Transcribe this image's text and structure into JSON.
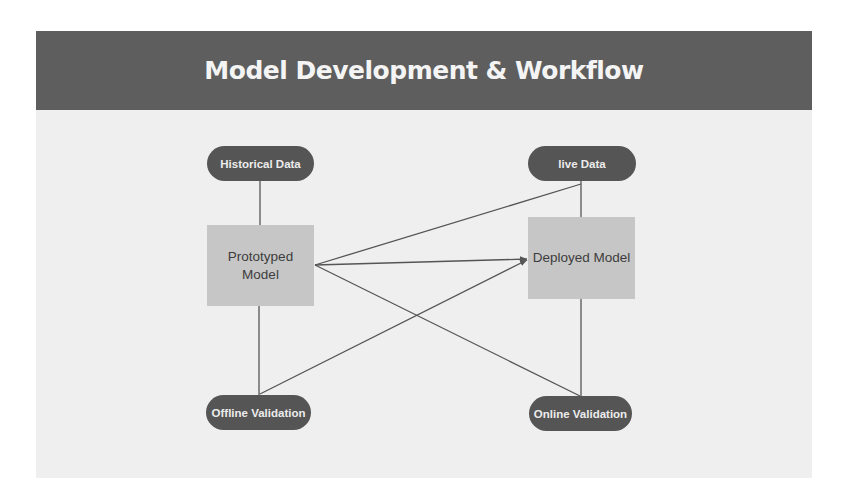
{
  "header": {
    "title": "Model Development & Workflow"
  },
  "colors": {
    "header_bg": "#5e5e5e",
    "pill_bg": "#555555",
    "box_bg": "#c6c6c6",
    "panel_bg": "#efefef",
    "edge": "#555555"
  },
  "nodes": {
    "historical_data": {
      "label": "Historical Data",
      "shape": "pill"
    },
    "live_data": {
      "label": "live Data",
      "shape": "pill"
    },
    "prototyped_model": {
      "label_line1": "Prototyped",
      "label_line2": "Model",
      "shape": "box"
    },
    "deployed_model": {
      "label": "Deployed Model",
      "shape": "box"
    },
    "offline_validation": {
      "label": "Offline Validation",
      "shape": "pill"
    },
    "online_validation": {
      "label": "Online Validation",
      "shape": "pill"
    }
  },
  "edges": [
    {
      "from": "historical_data",
      "to": "prototyped_model"
    },
    {
      "from": "prototyped_model",
      "to": "offline_validation"
    },
    {
      "from": "prototyped_model",
      "to": "live_data"
    },
    {
      "from": "prototyped_model",
      "to": "deployed_model",
      "arrow": true
    },
    {
      "from": "prototyped_model",
      "to": "online_validation"
    },
    {
      "from": "offline_validation",
      "to": "deployed_model",
      "arrow": true
    },
    {
      "from": "live_data",
      "to": "deployed_model"
    },
    {
      "from": "deployed_model",
      "to": "online_validation"
    }
  ]
}
